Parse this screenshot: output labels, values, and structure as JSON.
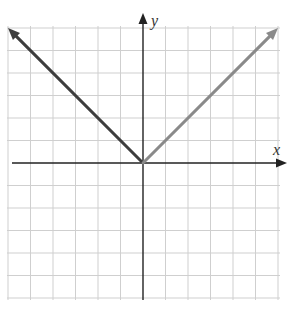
{
  "chart_data": {
    "type": "line",
    "title": "",
    "xlabel": "x",
    "ylabel": "y",
    "xlim": [
      -6,
      6
    ],
    "ylim": [
      -6,
      6
    ],
    "grid": true,
    "legend": null,
    "series": [
      {
        "name": "left branch",
        "color": "#3d3d3d",
        "x": [
          0,
          -6
        ],
        "y": [
          0,
          6
        ]
      },
      {
        "name": "right branch",
        "color": "#8a8a8a",
        "x": [
          0,
          6
        ],
        "y": [
          0,
          6
        ]
      }
    ],
    "function": "y = |x|"
  },
  "axes": {
    "x_label": "x",
    "y_label": "y",
    "axis_color": "#222222",
    "grid_color": "#cfcfcf"
  }
}
